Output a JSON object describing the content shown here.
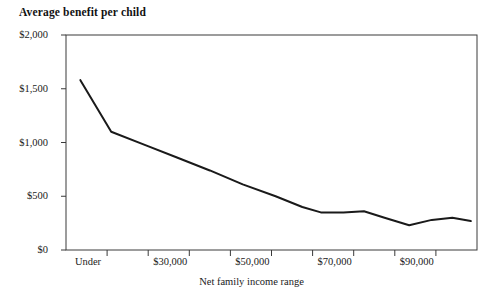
{
  "chart_data": {
    "type": "line",
    "title": "Average benefit per child",
    "xlabel": "Net family income range",
    "ylabel": "",
    "ylim": [
      0,
      2000
    ],
    "grid": false,
    "legend": null,
    "y_ticks": [
      {
        "value": 2000,
        "label": "$2,000"
      },
      {
        "value": 1500,
        "label": "$1,500"
      },
      {
        "value": 1000,
        "label": "$1,000"
      },
      {
        "value": 500,
        "label": "$500"
      },
      {
        "value": 0,
        "label": "$0"
      }
    ],
    "x_ticks": [
      {
        "index": 0,
        "label": "Under"
      },
      {
        "index": 1,
        "label": ""
      },
      {
        "index": 2,
        "label": "$30,000"
      },
      {
        "index": 3,
        "label": ""
      },
      {
        "index": 4,
        "label": "$50,000"
      },
      {
        "index": 5,
        "label": ""
      },
      {
        "index": 6,
        "label": "$70,000"
      },
      {
        "index": 7,
        "label": ""
      },
      {
        "index": 8,
        "label": "$90,000"
      },
      {
        "index": 9,
        "label": ""
      },
      {
        "index": 10,
        "label": ""
      }
    ],
    "series": [
      {
        "name": "Average benefit per child",
        "color": "#1a1a1a",
        "x": [
          0.35,
          1.1,
          1.9,
          2.7,
          3.5,
          4.3,
          5.1,
          5.75,
          6.2,
          6.75,
          7.25,
          7.75,
          8.35,
          8.9,
          9.4,
          9.85
        ],
        "values": [
          1580,
          1100,
          980,
          860,
          740,
          610,
          500,
          400,
          350,
          350,
          360,
          300,
          230,
          280,
          300,
          270
        ]
      }
    ]
  },
  "axis": {
    "plot_left": 66,
    "plot_right": 477,
    "plot_top": 35,
    "plot_bottom": 250
  }
}
